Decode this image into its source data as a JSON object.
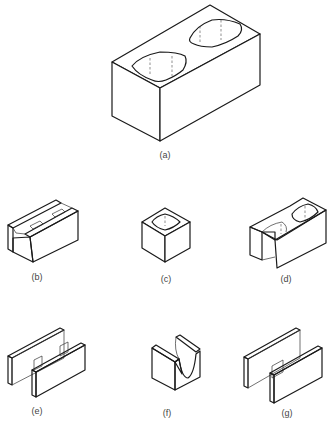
{
  "figure": {
    "panels": [
      {
        "id": "a",
        "label": "(a)",
        "shape": "two-core stretcher block"
      },
      {
        "id": "b",
        "label": "(b)",
        "shape": "bond beam block"
      },
      {
        "id": "c",
        "label": "(c)",
        "shape": "single-core column block"
      },
      {
        "id": "d",
        "label": "(d)",
        "shape": "open-end block"
      },
      {
        "id": "e",
        "label": "(e)",
        "shape": "double open-end (H) block"
      },
      {
        "id": "f",
        "label": "(f)",
        "shape": "lintel (U) block"
      },
      {
        "id": "g",
        "label": "(g)",
        "shape": "pilaster/H block"
      }
    ]
  },
  "colors": {
    "line": "#1a1a1a",
    "label": "#444444",
    "background": "#ffffff"
  }
}
